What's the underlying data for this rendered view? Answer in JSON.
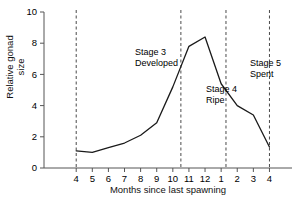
{
  "chart_data": {
    "type": "line",
    "title": "",
    "xlabel": "Months since last spawning",
    "ylabel": "Relative gonad size",
    "categories": [
      "4",
      "5",
      "6",
      "7",
      "8",
      "9",
      "10",
      "11",
      "12",
      "1",
      "2",
      "3",
      "4"
    ],
    "x": [
      4,
      5,
      6,
      7,
      8,
      9,
      10,
      11,
      12,
      13,
      14,
      15,
      16
    ],
    "values": [
      1.1,
      1.0,
      1.3,
      1.6,
      2.1,
      2.9,
      5.2,
      7.8,
      8.4,
      5.4,
      4.0,
      3.4,
      1.35
    ],
    "series": [
      {
        "name": "Relative gonad size",
        "values": [
          1.1,
          1.0,
          1.3,
          1.6,
          2.1,
          2.9,
          5.2,
          7.8,
          8.4,
          5.4,
          4.0,
          3.4,
          1.35
        ]
      }
    ],
    "ylim": [
      0,
      10
    ],
    "yticks": [
      0,
      2,
      4,
      6,
      8,
      10
    ],
    "ytick_labels": [
      "0",
      "2",
      "4",
      "6",
      "8",
      "10"
    ],
    "xticks": [
      4,
      5,
      6,
      7,
      8,
      9,
      10,
      11,
      12,
      13,
      14,
      15,
      16
    ],
    "xtick_labels": [
      "4",
      "5",
      "6",
      "7",
      "8",
      "9",
      "10",
      "11",
      "12",
      "1",
      "2",
      "3",
      "4"
    ],
    "grid": false,
    "legend": "none",
    "line_color": "#1a1a1a",
    "axis_color": "#555555",
    "vlines": [
      {
        "x": 4.0,
        "style": "dashed"
      },
      {
        "x": 10.5,
        "style": "dashed"
      },
      {
        "x": 13.3,
        "style": "dashed"
      },
      {
        "x": 16.0,
        "style": "dashed"
      }
    ],
    "annotations": [
      {
        "name": "stage-3",
        "line1": "Stage 3",
        "line2": "Developed",
        "text": "Stage 3\nDeveloped"
      },
      {
        "name": "stage-4",
        "line1": "Stage 4",
        "line2": "Ripe",
        "text": "Stage 4\nRipe"
      },
      {
        "name": "stage-5",
        "line1": "Stage 5",
        "line2": "Spent",
        "text": "Stage 5\nSpent"
      }
    ]
  }
}
